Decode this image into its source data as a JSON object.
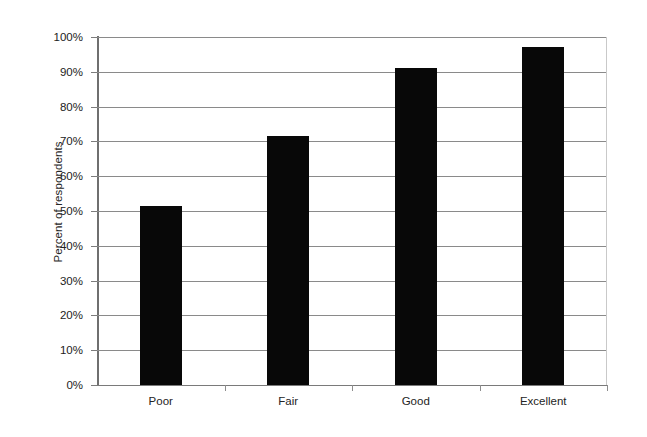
{
  "chart_data": {
    "type": "bar",
    "title": "",
    "subtitle": "",
    "xlabel": "",
    "ylabel": "Percent of respondents",
    "categories": [
      "Poor",
      "Fair",
      "Good",
      "Excellent"
    ],
    "values": [
      51.5,
      71.5,
      91,
      97
    ],
    "value_labels": [
      "51.5%",
      "71.5%",
      "91%",
      "97%"
    ],
    "series": [
      {
        "name": "Percent of respondents",
        "values": [
          51.5,
          71.5,
          91,
          97
        ],
        "color": "#080808"
      }
    ],
    "ylim": [
      0,
      100
    ],
    "y_tick_step": 10,
    "y_tick_labels": [
      "100%",
      "90%",
      "80%",
      "70%",
      "60%",
      "50%",
      "40%",
      "30%",
      "20%",
      "10%",
      "0%"
    ],
    "y_tick_values": [
      100,
      90,
      80,
      70,
      60,
      50,
      40,
      30,
      20,
      10,
      0
    ],
    "grid": "horizontal",
    "legend": "none",
    "legend_position": "none",
    "bar_color": "#080808",
    "gridline_color": "#8a8a8a",
    "axis_color": "#7a7a7a",
    "background_color": "#ffffff"
  }
}
